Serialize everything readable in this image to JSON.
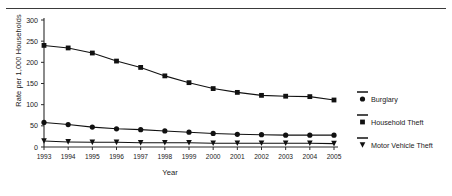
{
  "figure": {
    "top_rule": "horizontal-rule"
  },
  "chart_data": {
    "type": "line",
    "title": "",
    "xlabel": "Year",
    "ylabel": "Rate per 1,000 Households",
    "categories": [
      "1993",
      "1994",
      "1995",
      "1996",
      "1997",
      "1998",
      "1999",
      "2000",
      "2001",
      "2002",
      "2003",
      "2004",
      "2005"
    ],
    "x": [
      1993,
      1994,
      1995,
      1996,
      1997,
      1998,
      1999,
      2000,
      2001,
      2002,
      2003,
      2004,
      2005
    ],
    "xlim": [
      1993,
      2005
    ],
    "ylim": [
      0,
      300
    ],
    "yticks": [
      0,
      50,
      100,
      150,
      200,
      250,
      300
    ],
    "grid": false,
    "legend_position": "right",
    "series": [
      {
        "name": "Burglary",
        "marker": "square",
        "values": [
          240,
          234,
          222,
          203,
          188,
          168,
          152,
          138,
          129,
          122,
          120,
          119,
          111
        ]
      },
      {
        "name": "Household Theft",
        "marker": "circle",
        "values": [
          58,
          53,
          47,
          43,
          41,
          38,
          35,
          32,
          30,
          29,
          28,
          28,
          28
        ]
      },
      {
        "name": "Motor Vehicle Theft",
        "marker": "triangle-down",
        "values": [
          14,
          12,
          11,
          11,
          10,
          10,
          10,
          9,
          9,
          9,
          9,
          9,
          8
        ]
      }
    ]
  },
  "legend": {
    "items": [
      {
        "label": "Burglary",
        "marker": "circle"
      },
      {
        "label": "Household Theft",
        "marker": "square"
      },
      {
        "label": "Motor Vehicle Theft",
        "marker": "triangle-down"
      }
    ]
  },
  "colors": {
    "ink": "#111111",
    "axis": "#2b2b2b",
    "rule": "#3a3a3a",
    "background": "#ffffff"
  }
}
